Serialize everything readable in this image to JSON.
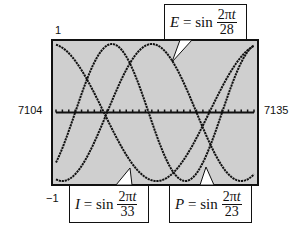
{
  "chart_data": {
    "type": "line",
    "title": "",
    "xlabel": "",
    "ylabel": "",
    "xlim": [
      7104,
      7135
    ],
    "ylim": [
      -1,
      1
    ],
    "x_tick_labels": [
      "7104",
      "7135"
    ],
    "y_tick_labels": [
      "1",
      "-1"
    ],
    "grid": false,
    "background": "#cfcfcf",
    "line_color": "#111111",
    "series": [
      {
        "name": "E",
        "label": "E = sin(2πt/28)",
        "period": 28,
        "var": "E",
        "denominator": "28"
      },
      {
        "name": "I",
        "label": "I = sin(2πt/33)",
        "period": 33,
        "var": "I",
        "denominator": "33"
      },
      {
        "name": "P",
        "label": "P = sin(2πt/23)",
        "period": 23,
        "var": "P",
        "denominator": "23"
      }
    ]
  },
  "labels": {
    "y_top": "1",
    "y_bottom": "−1",
    "x_left": "7104",
    "x_right": "7135",
    "eq_sin": " = sin",
    "numerator": "2π",
    "numerator_var": "t"
  }
}
